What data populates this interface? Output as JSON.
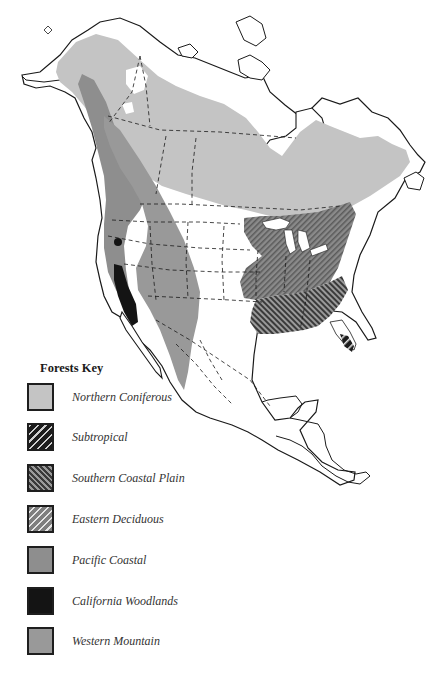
{
  "legend": {
    "title": "Forests Key",
    "items": [
      {
        "id": "northern-coniferous",
        "label": "Northern Coniferous",
        "fill": "#c4c4c4",
        "pattern": "solid"
      },
      {
        "id": "subtropical",
        "label": "Subtropical",
        "fill": "#1c1c1c",
        "pattern": "light-stripes-on-dark"
      },
      {
        "id": "southern-coastal-plain",
        "label": "Southern Coastal Plain",
        "fill": "#6a6a6a",
        "pattern": "dark-stripes-on-gray"
      },
      {
        "id": "eastern-deciduous",
        "label": "Eastern Deciduous",
        "fill": "#8c8c8c",
        "pattern": "white-stripes-on-gray"
      },
      {
        "id": "pacific-coastal",
        "label": "Pacific Coastal",
        "fill": "#8e8e8e",
        "pattern": "solid"
      },
      {
        "id": "california-woodlands",
        "label": "California Woodlands",
        "fill": "#141414",
        "pattern": "solid"
      },
      {
        "id": "western-mountain",
        "label": "Western Mountain",
        "fill": "#999999",
        "pattern": "solid"
      }
    ]
  },
  "map": {
    "region": "North America",
    "land_fill": "#ffffff",
    "outline_color": "#1a1a1a",
    "boundary_style": "dashed"
  }
}
